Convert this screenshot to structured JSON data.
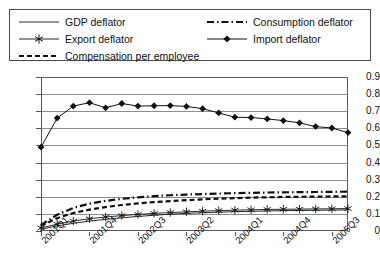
{
  "legend": {
    "entries": [
      {
        "label": "GDP deflator",
        "style": "solid-thin",
        "marker": "none",
        "color": "#555555"
      },
      {
        "label": "Export deflator",
        "style": "solid-thin",
        "marker": "asterisk",
        "color": "#333333"
      },
      {
        "label": "Compensation per employee",
        "style": "dashed",
        "marker": "none",
        "color": "#111111"
      },
      {
        "label": "Consumption deflator",
        "style": "dash-dot",
        "marker": "none",
        "color": "#111111"
      },
      {
        "label": "Import deflator",
        "style": "solid-thin",
        "marker": "diamond",
        "color": "#111111"
      }
    ]
  },
  "axes": {
    "y_ticks": [
      "0",
      "0.1",
      "0.2",
      "0.3",
      "0.4",
      "0.5",
      "0.6",
      "0.7",
      "0.8",
      "0.9"
    ],
    "x_ticks": [
      "2001Q1",
      "2001Q4",
      "2002Q3",
      "2003Q2",
      "2004Q1",
      "2004Q4",
      "2005Q3"
    ]
  },
  "chart_data": {
    "type": "line",
    "title": "",
    "xlabel": "",
    "ylabel": "",
    "ylim": [
      0,
      0.9
    ],
    "ytick_step": 0.1,
    "grid": true,
    "legend_position": "top",
    "x": [
      "2001Q1",
      "2001Q2",
      "2001Q3",
      "2001Q4",
      "2002Q1",
      "2002Q2",
      "2002Q3",
      "2002Q4",
      "2003Q1",
      "2003Q2",
      "2003Q3",
      "2003Q4",
      "2004Q1",
      "2004Q2",
      "2004Q3",
      "2004Q4",
      "2005Q1",
      "2005Q2",
      "2005Q3",
      "2005Q4"
    ],
    "x_tick_indices": [
      0,
      3,
      6,
      9,
      12,
      15,
      18
    ],
    "series": [
      {
        "name": "GDP deflator",
        "style": "solid-thin",
        "marker": "none",
        "values": [
          0.01,
          0.03,
          0.045,
          0.058,
          0.068,
          0.077,
          0.085,
          0.092,
          0.098,
          0.103,
          0.107,
          0.11,
          0.113,
          0.115,
          0.117,
          0.119,
          0.12,
          0.121,
          0.122,
          0.123
        ]
      },
      {
        "name": "Export deflator",
        "style": "solid-thin",
        "marker": "asterisk",
        "values": [
          0.018,
          0.04,
          0.058,
          0.072,
          0.082,
          0.09,
          0.097,
          0.103,
          0.108,
          0.112,
          0.116,
          0.119,
          0.122,
          0.124,
          0.126,
          0.127,
          0.128,
          0.129,
          0.13,
          0.131
        ]
      },
      {
        "name": "Compensation per employee",
        "style": "dashed",
        "marker": "none",
        "values": [
          0.03,
          0.075,
          0.105,
          0.125,
          0.14,
          0.152,
          0.161,
          0.169,
          0.175,
          0.18,
          0.185,
          0.189,
          0.192,
          0.195,
          0.197,
          0.199,
          0.2,
          0.201,
          0.202,
          0.203
        ]
      },
      {
        "name": "Consumption deflator",
        "style": "dash-dot",
        "marker": "none",
        "values": [
          0.035,
          0.095,
          0.135,
          0.16,
          0.176,
          0.188,
          0.197,
          0.204,
          0.209,
          0.213,
          0.216,
          0.219,
          0.221,
          0.223,
          0.225,
          0.226,
          0.227,
          0.228,
          0.229,
          0.23
        ]
      },
      {
        "name": "Import deflator",
        "style": "solid-thin",
        "marker": "diamond",
        "values": [
          0.49,
          0.66,
          0.73,
          0.75,
          0.72,
          0.745,
          0.73,
          0.732,
          0.733,
          0.728,
          0.715,
          0.69,
          0.665,
          0.663,
          0.655,
          0.645,
          0.632,
          0.61,
          0.602,
          0.575
        ]
      }
    ]
  }
}
